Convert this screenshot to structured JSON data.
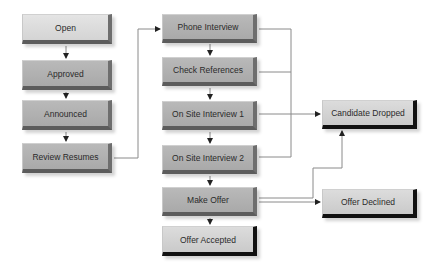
{
  "diagram": {
    "type": "flowchart",
    "nodes": {
      "open": "Open",
      "approved": "Approved",
      "announced": "Announced",
      "review_resumes": "Review Resumes",
      "phone_interview": "Phone Interview",
      "check_references": "Check References",
      "on_site_1": "On Site Interview 1",
      "on_site_2": "On Site Interview 2",
      "make_offer": "Make Offer",
      "offer_accepted": "Offer Accepted",
      "candidate_dropped": "Candidate Dropped",
      "offer_declined": "Offer Declined"
    },
    "edges": [
      {
        "from": "Open",
        "to": "Approved"
      },
      {
        "from": "Approved",
        "to": "Announced"
      },
      {
        "from": "Announced",
        "to": "Review Resumes"
      },
      {
        "from": "Review Resumes",
        "to": "Phone Interview"
      },
      {
        "from": "Phone Interview",
        "to": "Check References"
      },
      {
        "from": "Check References",
        "to": "On Site Interview 1"
      },
      {
        "from": "On Site Interview 1",
        "to": "On Site Interview 2"
      },
      {
        "from": "On Site Interview 2",
        "to": "Make Offer"
      },
      {
        "from": "Make Offer",
        "to": "Offer Accepted"
      },
      {
        "from": "Phone Interview",
        "to": "Candidate Dropped"
      },
      {
        "from": "Check References",
        "to": "Candidate Dropped"
      },
      {
        "from": "On Site Interview 1",
        "to": "Candidate Dropped"
      },
      {
        "from": "On Site Interview 2",
        "to": "Candidate Dropped"
      },
      {
        "from": "Make Offer",
        "to": "Candidate Dropped"
      },
      {
        "from": "Make Offer",
        "to": "Offer Declined"
      }
    ],
    "colors": {
      "node_face": "#b0b0b0",
      "node_face_light": "#dcdcdc",
      "bevel": "#5c5c5c",
      "terminal_bevel": "#111111",
      "connector": "#8a8a8a",
      "arrowhead": "#222222"
    }
  }
}
